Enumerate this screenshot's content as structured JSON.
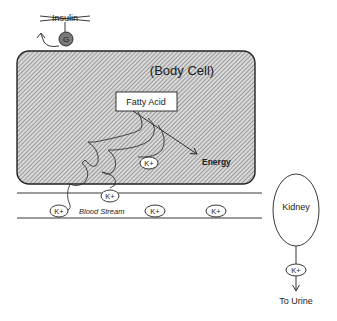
{
  "diagram": {
    "insulin_label": "Insulin",
    "glucose_receptor_label": "G",
    "cell_label": "(Body Cell)",
    "fatty_acid_label": "Fatty Acid",
    "energy_label": "Energy",
    "blood_stream_label": "Blood Stream",
    "kidney_label": "Kidney",
    "urine_label": "To Urine",
    "potassium_labels": {
      "in_cell": "K+",
      "membrane": "K+",
      "blood_1": "K+",
      "blood_2": "K+",
      "blood_3": "K+",
      "urine": "K+"
    },
    "colors": {
      "line": "#222222",
      "hatch": "#888888",
      "receptor_fill": "#777777"
    }
  }
}
